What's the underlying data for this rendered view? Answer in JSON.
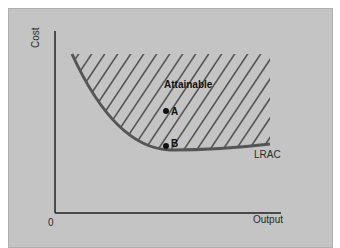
{
  "figure": {
    "y_axis_label": "Cost",
    "x_axis_label": "Output",
    "origin_label": "0",
    "region_label": "Attainable",
    "curve_label": "LRAC",
    "points": [
      {
        "name": "A",
        "label": "A"
      },
      {
        "name": "B",
        "label": "B"
      }
    ],
    "colors": {
      "background": "#c4c4c4",
      "axis": "#222222",
      "curve": "#555555",
      "hatch": "#555555"
    }
  }
}
